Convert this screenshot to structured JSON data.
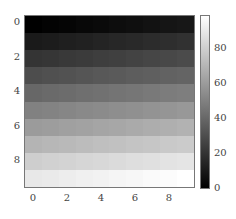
{
  "chart_data": {
    "type": "heatmap",
    "title": "",
    "xlabel": "",
    "ylabel": "",
    "colormap": "gray",
    "x_ticks": [
      "0",
      "2",
      "4",
      "6",
      "8"
    ],
    "y_ticks": [
      "0",
      "2",
      "4",
      "6",
      "8"
    ],
    "colorbar_ticks": [
      "0",
      "20",
      "40",
      "60",
      "80"
    ],
    "colorbar_range": [
      0,
      99
    ],
    "rows": 10,
    "cols": 10,
    "values": [
      [
        0,
        1,
        2,
        3,
        4,
        5,
        6,
        7,
        8,
        9
      ],
      [
        10,
        11,
        12,
        13,
        14,
        15,
        16,
        17,
        18,
        19
      ],
      [
        20,
        21,
        22,
        23,
        24,
        25,
        26,
        27,
        28,
        29
      ],
      [
        30,
        31,
        32,
        33,
        34,
        35,
        36,
        37,
        38,
        39
      ],
      [
        40,
        41,
        42,
        43,
        44,
        45,
        46,
        47,
        48,
        49
      ],
      [
        50,
        51,
        52,
        53,
        54,
        55,
        56,
        57,
        58,
        59
      ],
      [
        60,
        61,
        62,
        63,
        64,
        65,
        66,
        67,
        68,
        69
      ],
      [
        70,
        71,
        72,
        73,
        74,
        75,
        76,
        77,
        78,
        79
      ],
      [
        80,
        81,
        82,
        83,
        84,
        85,
        86,
        87,
        88,
        89
      ],
      [
        90,
        91,
        92,
        93,
        94,
        95,
        96,
        97,
        98,
        99
      ]
    ]
  },
  "axes": {
    "x_ticks": [
      "0",
      "2",
      "4",
      "6",
      "8"
    ],
    "y_ticks": [
      "0",
      "2",
      "4",
      "6",
      "8"
    ],
    "colorbar_ticks": [
      "0",
      "20",
      "40",
      "60",
      "80"
    ]
  }
}
